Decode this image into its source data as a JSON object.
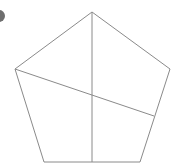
{
  "diagram": {
    "type": "pentagon-with-lines",
    "stroke_color": "#8a8a8a",
    "bullet_color": "#6e6e6e",
    "pentagon_points": [
      [
        92,
        12
      ],
      [
        170,
        69
      ],
      [
        140,
        162
      ],
      [
        44,
        162
      ],
      [
        15,
        69
      ]
    ],
    "lines": [
      {
        "from": [
          92,
          12
        ],
        "to": [
          92,
          162
        ]
      },
      {
        "from": [
          15,
          69
        ],
        "to": [
          154,
          116
        ]
      }
    ]
  }
}
